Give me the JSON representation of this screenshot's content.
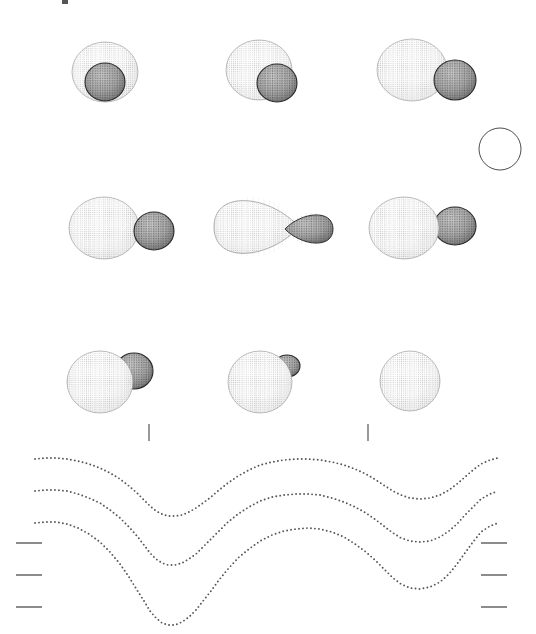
{
  "figure": {
    "title": "",
    "background_color": "#ffffff",
    "width": 536,
    "height": 634,
    "stroke_color": "#3a3a3a",
    "dot_color": "#555555",
    "primary_fill": "#fdfdfd",
    "secondary_fill": "#9a9a9a",
    "top_artifact": {
      "x": 62,
      "y": 0,
      "width": 6,
      "height": 4,
      "color": "#555555"
    }
  },
  "geometry_panels": {
    "description": "Binary star Roche-geometry renderings at successive orbital phases",
    "rows": [
      {
        "row_index": 0,
        "center_y": 72,
        "panels": [
          {
            "name": "phase-panel-1",
            "phase_label": "",
            "primary": {
              "cx": 105,
              "cy": 72,
              "rx": 33,
              "ry": 30,
              "mesh": "dotted",
              "shade": "light"
            },
            "secondary": {
              "cx": 105,
              "cy": 82,
              "rx": 20,
              "ry": 19,
              "mesh": "dotted",
              "shade": "dark",
              "in_front": true
            }
          },
          {
            "name": "phase-panel-2",
            "phase_label": "",
            "primary": {
              "cx": 259,
              "cy": 70,
              "rx": 33,
              "ry": 30,
              "mesh": "dotted",
              "shade": "light"
            },
            "secondary": {
              "cx": 277,
              "cy": 83,
              "rx": 20,
              "ry": 19,
              "mesh": "dotted",
              "shade": "dark",
              "in_front": true
            }
          },
          {
            "name": "phase-panel-3",
            "phase_label": "",
            "primary": {
              "cx": 412,
              "cy": 70,
              "rx": 35,
              "ry": 31,
              "mesh": "dotted",
              "shade": "light"
            },
            "secondary": {
              "cx": 455,
              "cy": 80,
              "rx": 21,
              "ry": 20,
              "mesh": "dotted",
              "shade": "dark",
              "in_front": true
            }
          }
        ]
      },
      {
        "row_index": 1,
        "center_y": 230,
        "panels": [
          {
            "name": "phase-panel-4",
            "phase_label": "",
            "primary": {
              "cx": 104,
              "cy": 228,
              "rx": 35,
              "ry": 31,
              "mesh": "dotted",
              "shade": "light"
            },
            "secondary": {
              "cx": 154,
              "cy": 231,
              "rx": 20,
              "ry": 19,
              "mesh": "dotted",
              "shade": "dark",
              "in_front": true
            }
          },
          {
            "name": "phase-panel-5",
            "phase_label": "",
            "primary": {
              "cx": 253,
              "cy": 227,
              "rx": 39,
              "ry": 30,
              "mesh": "dotted",
              "shade": "light",
              "teardrop": true
            },
            "secondary": {
              "cx": 311,
              "cy": 229,
              "rx": 22,
              "ry": 16,
              "mesh": "dotted",
              "shade": "dark",
              "teardrop": true
            }
          },
          {
            "name": "phase-panel-6",
            "phase_label": "",
            "primary": {
              "cx": 404,
              "cy": 228,
              "rx": 35,
              "ry": 31,
              "mesh": "dotted",
              "shade": "light"
            },
            "secondary": {
              "cx": 455,
              "cy": 226,
              "rx": 21,
              "ry": 19,
              "mesh": "dotted",
              "shade": "dark",
              "in_front": false
            }
          }
        ]
      },
      {
        "row_index": 2,
        "center_y": 380,
        "panels": [
          {
            "name": "phase-panel-7",
            "phase_label": "",
            "primary": {
              "cx": 100,
              "cy": 382,
              "rx": 33,
              "ry": 31,
              "mesh": "dotted",
              "shade": "light"
            },
            "secondary": {
              "cx": 134,
              "cy": 371,
              "rx": 19,
              "ry": 18,
              "mesh": "dotted",
              "shade": "dark",
              "in_front": false
            }
          },
          {
            "name": "phase-panel-8",
            "phase_label": "",
            "primary": {
              "cx": 260,
              "cy": 382,
              "rx": 32,
              "ry": 31,
              "mesh": "dotted",
              "shade": "light"
            },
            "secondary": {
              "cx": 287,
              "cy": 366,
              "rx": 13,
              "ry": 11,
              "mesh": "dotted",
              "shade": "dark",
              "in_front": false,
              "occulted": true
            }
          },
          {
            "name": "phase-panel-9",
            "phase_label": "",
            "primary": {
              "cx": 410,
              "cy": 381,
              "rx": 30,
              "ry": 30,
              "mesh": "dotted",
              "shade": "light"
            },
            "secondary": null
          }
        ]
      }
    ],
    "reference_circle": {
      "name": "reference-circle",
      "cx": 500,
      "cy": 149,
      "r": 21,
      "fill": "none",
      "stroke": "#3a3a3a"
    }
  },
  "phase_ticks": [
    {
      "name": "phase-tick-1",
      "x": 149,
      "y1": 424,
      "y2": 441
    },
    {
      "name": "phase-tick-2",
      "x": 368,
      "y1": 424,
      "y2": 441
    }
  ],
  "axis_ticks_left": [
    {
      "name": "axis-tick-left-1",
      "x1": 16,
      "x2": 42,
      "y": 543
    },
    {
      "name": "axis-tick-left-2",
      "x1": 16,
      "x2": 42,
      "y": 575
    },
    {
      "name": "axis-tick-left-3",
      "x1": 16,
      "x2": 42,
      "y": 607
    }
  ],
  "axis_ticks_right": [
    {
      "name": "axis-tick-right-1",
      "x1": 481,
      "x2": 507,
      "y": 543
    },
    {
      "name": "axis-tick-right-2",
      "x1": 481,
      "x2": 507,
      "y": 575
    },
    {
      "name": "axis-tick-right-3",
      "x1": 481,
      "x2": 507,
      "y": 607
    }
  ],
  "chart_data": {
    "type": "scatter",
    "title": "",
    "subtitle": "",
    "xlabel": "",
    "ylabel": "",
    "xlim": [
      0,
      1
    ],
    "ylim": [
      0,
      1
    ],
    "grid": false,
    "legend_position": "none",
    "marker": "dot",
    "series": [
      {
        "name": "light-curve-top",
        "color": "#555555",
        "points": [
          [
            35,
            459
          ],
          [
            45,
            458
          ],
          [
            56,
            458
          ],
          [
            67,
            459
          ],
          [
            78,
            461
          ],
          [
            89,
            464
          ],
          [
            100,
            468
          ],
          [
            110,
            473
          ],
          [
            120,
            479
          ],
          [
            129,
            486
          ],
          [
            137,
            493
          ],
          [
            144,
            500
          ],
          [
            150,
            506
          ],
          [
            156,
            511
          ],
          [
            162,
            514
          ],
          [
            168,
            516
          ],
          [
            175,
            516
          ],
          [
            182,
            515
          ],
          [
            189,
            512
          ],
          [
            196,
            508
          ],
          [
            203,
            503
          ],
          [
            211,
            497
          ],
          [
            219,
            490
          ],
          [
            228,
            483
          ],
          [
            238,
            476
          ],
          [
            249,
            470
          ],
          [
            260,
            465
          ],
          [
            272,
            462
          ],
          [
            284,
            460
          ],
          [
            296,
            459
          ],
          [
            308,
            459
          ],
          [
            320,
            460
          ],
          [
            332,
            462
          ],
          [
            344,
            465
          ],
          [
            355,
            469
          ],
          [
            366,
            474
          ],
          [
            376,
            480
          ],
          [
            385,
            486
          ],
          [
            393,
            491
          ],
          [
            401,
            495
          ],
          [
            410,
            498
          ],
          [
            420,
            499
          ],
          [
            430,
            498
          ],
          [
            440,
            495
          ],
          [
            449,
            490
          ],
          [
            457,
            484
          ],
          [
            465,
            477
          ],
          [
            473,
            470
          ],
          [
            481,
            464
          ],
          [
            490,
            460
          ],
          [
            498,
            458
          ]
        ]
      },
      {
        "name": "light-curve-middle",
        "color": "#555555",
        "points": [
          [
            35,
            491
          ],
          [
            45,
            490
          ],
          [
            56,
            490
          ],
          [
            67,
            491
          ],
          [
            78,
            494
          ],
          [
            89,
            498
          ],
          [
            100,
            503
          ],
          [
            110,
            510
          ],
          [
            120,
            518
          ],
          [
            129,
            527
          ],
          [
            137,
            536
          ],
          [
            144,
            545
          ],
          [
            150,
            553
          ],
          [
            156,
            559
          ],
          [
            162,
            563
          ],
          [
            168,
            565
          ],
          [
            175,
            565
          ],
          [
            182,
            563
          ],
          [
            189,
            559
          ],
          [
            196,
            554
          ],
          [
            203,
            547
          ],
          [
            211,
            539
          ],
          [
            219,
            531
          ],
          [
            228,
            522
          ],
          [
            238,
            514
          ],
          [
            249,
            507
          ],
          [
            260,
            501
          ],
          [
            272,
            497
          ],
          [
            284,
            495
          ],
          [
            296,
            494
          ],
          [
            308,
            494
          ],
          [
            320,
            495
          ],
          [
            332,
            498
          ],
          [
            344,
            502
          ],
          [
            355,
            507
          ],
          [
            366,
            513
          ],
          [
            376,
            520
          ],
          [
            385,
            527
          ],
          [
            393,
            533
          ],
          [
            401,
            538
          ],
          [
            410,
            541
          ],
          [
            420,
            542
          ],
          [
            430,
            541
          ],
          [
            440,
            537
          ],
          [
            449,
            531
          ],
          [
            457,
            524
          ],
          [
            465,
            515
          ],
          [
            473,
            507
          ],
          [
            481,
            499
          ],
          [
            490,
            494
          ],
          [
            498,
            491
          ]
        ]
      },
      {
        "name": "light-curve-bottom",
        "color": "#555555",
        "points": [
          [
            35,
            523
          ],
          [
            45,
            522
          ],
          [
            56,
            522
          ],
          [
            67,
            524
          ],
          [
            78,
            528
          ],
          [
            89,
            534
          ],
          [
            100,
            542
          ],
          [
            110,
            552
          ],
          [
            120,
            564
          ],
          [
            129,
            577
          ],
          [
            137,
            590
          ],
          [
            144,
            601
          ],
          [
            150,
            611
          ],
          [
            156,
            618
          ],
          [
            162,
            623
          ],
          [
            168,
            625
          ],
          [
            175,
            625
          ],
          [
            182,
            622
          ],
          [
            189,
            617
          ],
          [
            196,
            610
          ],
          [
            203,
            601
          ],
          [
            211,
            591
          ],
          [
            219,
            580
          ],
          [
            228,
            569
          ],
          [
            238,
            558
          ],
          [
            249,
            549
          ],
          [
            260,
            541
          ],
          [
            272,
            535
          ],
          [
            284,
            531
          ],
          [
            296,
            529
          ],
          [
            308,
            528
          ],
          [
            320,
            529
          ],
          [
            332,
            532
          ],
          [
            344,
            537
          ],
          [
            355,
            544
          ],
          [
            366,
            552
          ],
          [
            376,
            561
          ],
          [
            385,
            570
          ],
          [
            393,
            578
          ],
          [
            401,
            584
          ],
          [
            410,
            588
          ],
          [
            420,
            589
          ],
          [
            430,
            587
          ],
          [
            440,
            582
          ],
          [
            449,
            574
          ],
          [
            457,
            564
          ],
          [
            465,
            553
          ],
          [
            473,
            542
          ],
          [
            481,
            532
          ],
          [
            490,
            526
          ],
          [
            498,
            523
          ]
        ]
      }
    ]
  }
}
